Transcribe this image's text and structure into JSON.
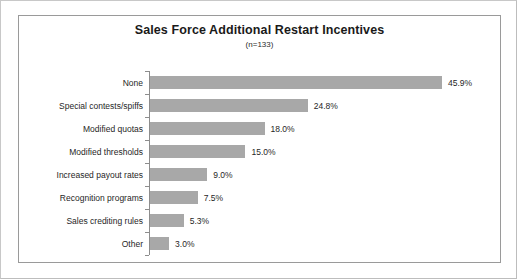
{
  "chart_data": {
    "type": "bar",
    "orientation": "horizontal",
    "title": "Sales Force Additional Restart Incentives",
    "subtitle": "(n=133)",
    "xlabel": "",
    "ylabel": "",
    "grid": false,
    "legend": "none",
    "xlim": [
      0,
      50
    ],
    "value_suffix": "%",
    "categories": [
      "None",
      "Special contests/spiffs",
      "Modified quotas",
      "Modified thresholds",
      "Increased payout rates",
      "Recognition programs",
      "Sales crediting rules",
      "Other"
    ],
    "values": [
      45.9,
      24.8,
      18.0,
      15.0,
      9.0,
      7.5,
      5.3,
      3.0
    ],
    "data_labels": [
      "45.9%",
      "24.8%",
      "18.0%",
      "15.0%",
      "9.0%",
      "7.5%",
      "5.3%",
      "3.0%"
    ],
    "bar_color": "#a8a8a8",
    "axis_color": "#8d8d8d",
    "frame_color": "#9a9a9a",
    "background": "#ffffff",
    "text_color": "#1f1f1f"
  }
}
